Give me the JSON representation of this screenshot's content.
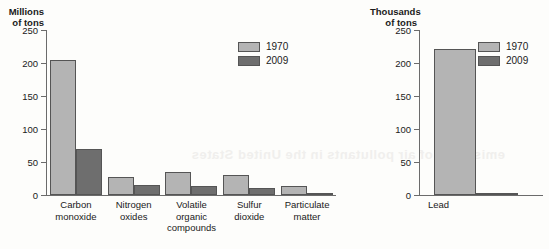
{
  "bleed_artifact": "emissions of air pollutants in the United States",
  "chart_data": [
    {
      "id": "left",
      "type": "bar",
      "title": "",
      "ylabel": "Millions\nof tons",
      "xlabel": "",
      "ylim": [
        0,
        250
      ],
      "yticks": [
        0,
        50,
        100,
        150,
        200,
        250
      ],
      "grid": false,
      "legend_position": "top-right",
      "categories": [
        "Carbon\nmonoxide",
        "Nitrogen\noxides",
        "Volatile\norganic\ncompounds",
        "Sulfur\ndioxide",
        "Particulate\nmatter"
      ],
      "series": [
        {
          "name": "1970",
          "color": "#b4b4b4",
          "values": [
            204,
            27,
            35,
            31,
            14
          ]
        },
        {
          "name": "2009",
          "color": "#6e6e6e",
          "values": [
            69,
            15,
            14,
            10,
            2
          ]
        }
      ]
    },
    {
      "id": "right",
      "type": "bar",
      "title": "",
      "ylabel": "Thousands\nof tons",
      "xlabel": "",
      "ylim": [
        0,
        250
      ],
      "yticks": [
        0,
        50,
        100,
        150,
        200,
        250
      ],
      "grid": false,
      "legend_position": "top-right",
      "categories": [
        "Lead"
      ],
      "series": [
        {
          "name": "1970",
          "color": "#b4b4b4",
          "values": [
            221
          ]
        },
        {
          "name": "2009",
          "color": "#6e6e6e",
          "values": [
            1
          ]
        }
      ]
    }
  ]
}
